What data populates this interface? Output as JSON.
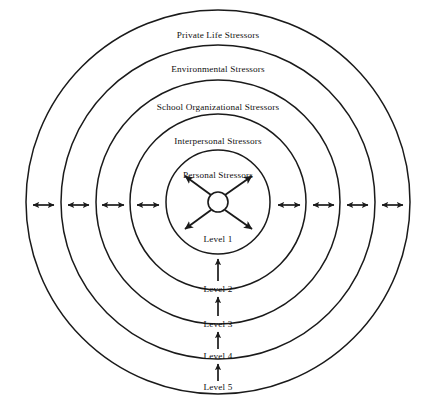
{
  "diagram": {
    "center": {
      "cx": 218,
      "cy": 202,
      "core_radius": 10
    },
    "stroke_color": "#1a1a1a",
    "background_color": "#ffffff",
    "rings": [
      {
        "id": "ring-5",
        "label": "Private Life Stressors",
        "radius": 192,
        "label_y": 38,
        "level": "Level 5"
      },
      {
        "id": "ring-4",
        "label": "Environmental Stressors",
        "radius": 157,
        "label_y": 72,
        "level": "Level 4"
      },
      {
        "id": "ring-3",
        "label": "School Organizational Stressors",
        "radius": 122,
        "label_y": 110,
        "level": "Level 3"
      },
      {
        "id": "ring-2",
        "label": "Interpersonal Stressors",
        "radius": 88,
        "label_y": 144,
        "level": "Level 2"
      },
      {
        "id": "ring-1",
        "label": "Personal Stressors",
        "radius": 52,
        "label_y": 178,
        "level": "Level 1"
      }
    ],
    "level_labels": [
      {
        "text": "Level 1",
        "x": 218,
        "y": 242
      },
      {
        "text": "Level 2",
        "x": 218,
        "y": 292
      },
      {
        "text": "Level 3",
        "x": 218,
        "y": 327
      },
      {
        "text": "Level 4",
        "x": 218,
        "y": 359
      },
      {
        "text": "Level 5",
        "x": 218,
        "y": 390
      }
    ],
    "horizontal_arrow_count_left": 4,
    "horizontal_arrow_count_right": 4,
    "vertical_arrow_count": 4,
    "core_arrow_count": 4,
    "core_arrow_directions": [
      "up-left",
      "up-right",
      "down-left",
      "down-right"
    ]
  }
}
